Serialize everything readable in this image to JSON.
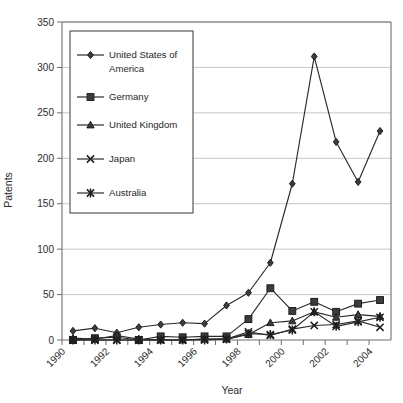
{
  "chart_data": {
    "type": "line",
    "title": "",
    "xlabel": "Year",
    "ylabel": "Patents",
    "xlim": [
      1990,
      2005
    ],
    "ylim": [
      0,
      350
    ],
    "ytick_step": 50,
    "yticks": [
      0,
      50,
      100,
      150,
      200,
      250,
      300,
      350
    ],
    "xticks": [
      1990,
      1991,
      1992,
      1993,
      1994,
      1995,
      1996,
      1997,
      1998,
      1999,
      2000,
      2001,
      2002,
      2003,
      2004
    ],
    "xtick_labels": [
      "1990",
      "",
      "1992",
      "",
      "1994",
      "",
      "1996",
      "",
      "1998",
      "",
      "2000",
      "",
      "2002",
      "",
      "2004"
    ],
    "x": [
      1990.5,
      1991.5,
      1992.5,
      1993.5,
      1994.5,
      1995.5,
      1996.5,
      1997.5,
      1998.5,
      1999.5,
      2000.5,
      2001.5,
      2002.5,
      2003.5,
      2004.5
    ],
    "categories": [
      "1990",
      "1991",
      "1992",
      "1993",
      "1994",
      "1995",
      "1996",
      "1997",
      "1998",
      "1999",
      "2000",
      "2001",
      "2002",
      "2003",
      "2004"
    ],
    "grid": "horizontal",
    "legend_position": "upper-left-inside",
    "series": [
      {
        "name": "United States of America",
        "marker": "diamond",
        "values": [
          10,
          13,
          8,
          14,
          17,
          19,
          18,
          38,
          52,
          85,
          172,
          312,
          218,
          174,
          230
        ]
      },
      {
        "name": "Germany",
        "marker": "square",
        "values": [
          0,
          2,
          3,
          0,
          4,
          3,
          4,
          4,
          23,
          57,
          32,
          42,
          31,
          40,
          44
        ]
      },
      {
        "name": "United Kingdom",
        "marker": "triangle",
        "values": [
          2,
          1,
          5,
          1,
          0,
          0,
          1,
          1,
          6,
          19,
          21,
          31,
          25,
          28,
          26
        ]
      },
      {
        "name": "Japan",
        "marker": "cross-x",
        "values": [
          0,
          0,
          0,
          0,
          0,
          0,
          1,
          1,
          9,
          5,
          12,
          16,
          17,
          21,
          14
        ]
      },
      {
        "name": "Australia",
        "marker": "asterisk",
        "values": [
          0,
          0,
          0,
          0,
          0,
          0,
          0,
          1,
          7,
          6,
          11,
          31,
          15,
          20,
          25
        ]
      }
    ],
    "legend_entries": [
      {
        "label": "United States of America",
        "marker": "diamond"
      },
      {
        "label": "Germany",
        "marker": "square"
      },
      {
        "label": "United Kingdom",
        "marker": "triangle"
      },
      {
        "label": "Japan",
        "marker": "cross-x"
      },
      {
        "label": "Australia",
        "marker": "asterisk"
      }
    ],
    "colors": {
      "line": "#2a2a2a",
      "marker": "#3c3c3c",
      "grid": "#b9b9b9",
      "axis": "#6e6e6e",
      "text": "#1f1f1f",
      "background": "#ffffff"
    }
  }
}
